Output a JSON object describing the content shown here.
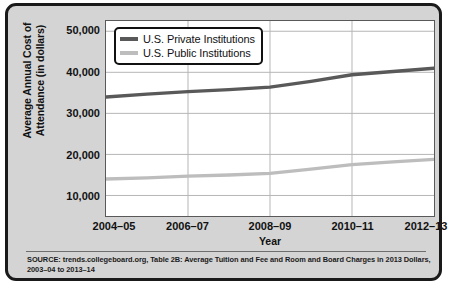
{
  "chart_data": {
    "type": "line",
    "title": "",
    "xlabel": "Year",
    "ylabel": "Average Annual Cost of Attendance (in dollars)",
    "ylabel_line1": "Average Annual Cost of",
    "ylabel_line2": "Attendance (in dollars)",
    "categories": [
      "2004–05",
      "2005–06",
      "2006–07",
      "2007–08",
      "2008–09",
      "2009–10",
      "2010–11",
      "2011–12",
      "2012–13"
    ],
    "tick_labels_x": [
      "2004–05",
      "2006–07",
      "2008–09",
      "2010–11",
      "2012–13"
    ],
    "tick_labels_y": [
      "50,000",
      "40,000",
      "30,000",
      "20,000",
      "10,000"
    ],
    "tick_values_y": [
      50000,
      40000,
      30000,
      20000,
      10000
    ],
    "ylim": [
      5000,
      52500
    ],
    "xlim": [
      2004,
      2012
    ],
    "grid": true,
    "legend_position": "top-left",
    "series": [
      {
        "name": "U.S. Private Institutions",
        "color": "#595959",
        "values": [
          34000,
          34700,
          35300,
          35800,
          36400,
          37800,
          39400,
          40200,
          41000
        ]
      },
      {
        "name": "U.S. Public Institutions",
        "color": "#bdbdbd",
        "values": [
          14000,
          14300,
          14700,
          15000,
          15400,
          16400,
          17500,
          18200,
          18800
        ]
      }
    ]
  },
  "legend": {
    "items": [
      {
        "label": "U.S. Private Institutions",
        "color": "#595959"
      },
      {
        "label": "U.S. Public Institutions",
        "color": "#bdbdbd"
      }
    ]
  },
  "source": {
    "text": "SOURCE: trends.collegeboard.org, Table 2B: Average Tuition and Fee and Room and Board Charges in 2013 Dollars, 2003–04 to 2013–14"
  },
  "style": {
    "frame_background": "#d4d4d4",
    "frame_border": "#1a1a1a",
    "plot_background": "#ffffff",
    "grid_color": "#b5b5b5",
    "axis_color": "#595959",
    "text_color": "#111111"
  }
}
